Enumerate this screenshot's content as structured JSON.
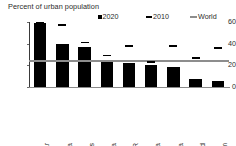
{
  "chart_data": {
    "type": "bar",
    "title": "Percent of urban population",
    "subtitle": "",
    "xlabel": "",
    "ylabel": "",
    "ylim": [
      0,
      60
    ],
    "yticks": [
      0,
      20,
      40,
      60
    ],
    "grid": false,
    "legend_position": "top",
    "categories": [
      "Myanmar",
      "Cambodia",
      "Philippines",
      "China",
      "Lao PDR",
      "Indonesia",
      "Mongolia",
      "Thailand",
      "Vietnam"
    ],
    "series": [
      {
        "name": "2020",
        "marker": "bar",
        "color": "#000000",
        "values": [
          59,
          40,
          37,
          24,
          22.5,
          20,
          18.5,
          7,
          6
        ]
      },
      {
        "name": "2010",
        "marker": "dash",
        "color": "#000000",
        "values": [
          59,
          57,
          41,
          29,
          38,
          23,
          38,
          27,
          36
        ]
      }
    ],
    "reference_line": {
      "name": "World",
      "color": "#8d8d8d",
      "value": 24
    },
    "legend": [
      {
        "label": "2020",
        "swatch": "square",
        "color": "#000000"
      },
      {
        "label": "2010",
        "swatch": "dash",
        "color": "#000000"
      },
      {
        "label": "World",
        "swatch": "line",
        "color": "#8d8d8d"
      }
    ]
  },
  "colors": {
    "bar": "#000000",
    "world_line": "#8d8d8d",
    "axis": "#3a3a3a",
    "text": "#2b2b2b",
    "background": "#ffffff"
  }
}
